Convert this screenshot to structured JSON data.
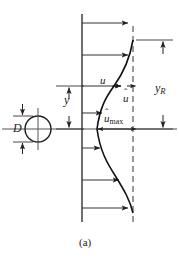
{
  "figure": {
    "caption": "(a)",
    "labels": {
      "diameter": "D",
      "distance_from_axis": "y",
      "local_velocity": "u",
      "velocity_defect": "u",
      "velocity_defect_hat": "̂",
      "max_velocity_defect_base": "u",
      "max_velocity_defect_sub": "max",
      "wake_half_width_base": "y",
      "wake_half_width_sub": "R"
    },
    "colors": {
      "ink": "#1a1a1a",
      "line": "#333333",
      "background": "#ffffff"
    },
    "geometry": {
      "reference_axis_x": 82,
      "freestream_dashed_x": 133,
      "centerline_y": 129,
      "profile_top_y": 39,
      "profile_bottom_y": 213,
      "cylinder_center_x": 38,
      "cylinder_center_y": 129,
      "cylinder_radius": 13
    },
    "arrow_rows": [
      {
        "y": 23,
        "from_x": 82,
        "to_x": 129
      },
      {
        "y": 55,
        "from_x": 82,
        "to_x": 129
      },
      {
        "y": 86,
        "from_x": 82,
        "to_x": 122
      },
      {
        "y": 113,
        "from_x": 82,
        "to_x": 103
      },
      {
        "y": 148,
        "from_x": 82,
        "to_x": 101
      },
      {
        "y": 180,
        "from_x": 82,
        "to_x": 120
      },
      {
        "y": 208,
        "from_x": 82,
        "to_x": 129
      }
    ]
  }
}
